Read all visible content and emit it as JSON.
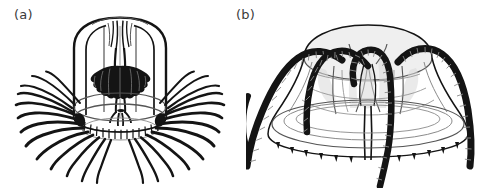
{
  "figure": {
    "background_color": "#ffffff",
    "ink_color": "#141414",
    "width": 493,
    "height": 188,
    "panels": [
      {
        "id": "a",
        "label": "(a)",
        "subject": "hydromedusa-tall-bell",
        "description": "Tall cylindrical bell medusa with manubrium, folded gonads and numerous fine marginal tentacles",
        "tentacle_count": 26,
        "bell_shape": "tall-cylindrical",
        "tentacle_style": "fine-curved"
      },
      {
        "id": "b",
        "label": "(b)",
        "subject": "hydromedusa-flat-bell",
        "description": "Flattened dome medusa with four thick banded tentacles looping over the bell and rudimentary marginal bulbs",
        "tentacle_count": 4,
        "bell_shape": "flattened-dome",
        "tentacle_style": "thick-banded",
        "marginal_bulb_count": 14
      }
    ]
  }
}
